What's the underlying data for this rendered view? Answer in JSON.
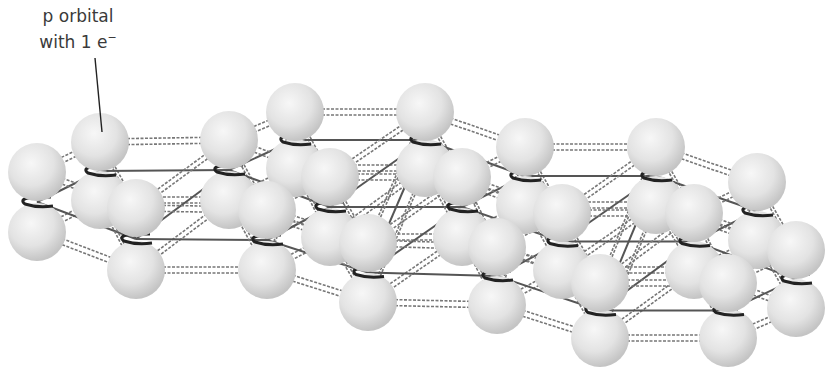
{
  "diagram": {
    "label": {
      "line1": "p orbital",
      "line2": "with 1 e",
      "superscript": "−"
    },
    "colors": {
      "sphere": "#e6e6e6",
      "sphere_shade": "#bdbdbd",
      "bond": "#555555",
      "carbon_arc": "#222222",
      "text": "#3a3a3a"
    },
    "atoms": [
      {
        "x": 37,
        "top": 172,
        "bot": 232
      },
      {
        "x": 100,
        "top": 142,
        "bot": 200
      },
      {
        "x": 136,
        "top": 208,
        "bot": 270
      },
      {
        "x": 229,
        "top": 140,
        "bot": 200
      },
      {
        "x": 295,
        "top": 112,
        "bot": 168
      },
      {
        "x": 267,
        "top": 210,
        "bot": 270
      },
      {
        "x": 330,
        "top": 177,
        "bot": 237
      },
      {
        "x": 368,
        "top": 243,
        "bot": 302
      },
      {
        "x": 425,
        "top": 112,
        "bot": 168
      },
      {
        "x": 462,
        "top": 177,
        "bot": 237
      },
      {
        "x": 497,
        "top": 247,
        "bot": 305
      },
      {
        "x": 525,
        "top": 147,
        "bot": 205
      },
      {
        "x": 562,
        "top": 213,
        "bot": 270
      },
      {
        "x": 600,
        "top": 283,
        "bot": 338
      },
      {
        "x": 656,
        "top": 147,
        "bot": 205
      },
      {
        "x": 694,
        "top": 213,
        "bot": 270
      },
      {
        "x": 728,
        "top": 283,
        "bot": 338
      },
      {
        "x": 757,
        "top": 182,
        "bot": 240
      },
      {
        "x": 796,
        "top": 250,
        "bot": 308
      }
    ]
  }
}
